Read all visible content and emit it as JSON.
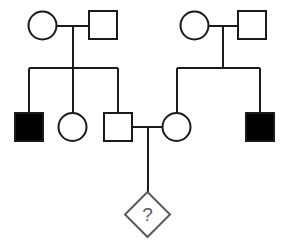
{
  "diagram": {
    "type": "pedigree-chart",
    "canvas": {
      "width": 290,
      "height": 241,
      "background": "#ffffff"
    },
    "style": {
      "line_color": "#1a1a1a",
      "line_width": 2,
      "affected_fill": "#000000",
      "unaffected_fill": "#ffffff",
      "proband_stroke": "#5a5a5a",
      "proband_text_color": "#5a5a5a",
      "symbol_size": 28,
      "circle_radius": 14
    },
    "legend_meaning": {
      "circle": "female",
      "square": "male",
      "filled": "affected",
      "open": "unaffected",
      "diamond": "unknown sex",
      "question_mark": "unknown affected status"
    },
    "generations": [
      {
        "id": "generation-1",
        "label": "I",
        "individuals": [
          {
            "id": "I-1",
            "data_name": "female-symbol-i-1",
            "shape": "circle",
            "sex": "female",
            "affected": false,
            "cx": 42.5,
            "cy": 25.5,
            "r": 14
          },
          {
            "id": "I-2",
            "data_name": "male-symbol-i-2",
            "shape": "square",
            "sex": "male",
            "affected": false,
            "x": 89,
            "y": 11,
            "size": 28
          },
          {
            "id": "I-3",
            "data_name": "female-symbol-i-3",
            "shape": "circle",
            "sex": "female",
            "affected": false,
            "cx": 194.5,
            "cy": 25.5,
            "r": 14
          },
          {
            "id": "I-4",
            "data_name": "male-symbol-i-4",
            "shape": "square",
            "sex": "male",
            "affected": false,
            "x": 238,
            "y": 11,
            "size": 28
          }
        ]
      },
      {
        "id": "generation-2",
        "label": "II",
        "individuals": [
          {
            "id": "II-1",
            "data_name": "affected-male-symbol-ii-1",
            "shape": "square",
            "sex": "male",
            "affected": true,
            "x": 15,
            "y": 113,
            "size": 28
          },
          {
            "id": "II-2",
            "data_name": "female-symbol-ii-2",
            "shape": "circle",
            "sex": "female",
            "affected": false,
            "cx": 72.5,
            "cy": 127,
            "r": 14
          },
          {
            "id": "II-3",
            "data_name": "male-symbol-ii-3",
            "shape": "square",
            "sex": "male",
            "affected": false,
            "x": 104,
            "y": 113,
            "size": 28
          },
          {
            "id": "II-4",
            "data_name": "female-symbol-ii-4",
            "shape": "circle",
            "sex": "female",
            "affected": false,
            "cx": 176.5,
            "cy": 127,
            "r": 14
          },
          {
            "id": "II-5",
            "data_name": "affected-male-symbol-ii-5",
            "shape": "square",
            "sex": "male",
            "affected": true,
            "x": 246,
            "y": 113,
            "size": 28
          }
        ]
      },
      {
        "id": "generation-3",
        "label": "III",
        "individuals": [
          {
            "id": "III-1",
            "data_name": "proband-diamond-symbol-iii-1",
            "shape": "diamond",
            "sex": "unknown",
            "affected": "unknown",
            "cx": 147.5,
            "cy": 214.5,
            "half_diagonal": 22.5,
            "label": "?"
          }
        ]
      }
    ],
    "matings": [
      {
        "id": "mating-1",
        "data_name": "mating-line-i-1-i-2",
        "partners": [
          "I-1",
          "I-2"
        ],
        "line_y": 25.5,
        "x_start": 56.5,
        "x_end": 89,
        "descent_x": 72.5,
        "descent_y_end": 68
      },
      {
        "id": "mating-2",
        "data_name": "mating-line-i-3-i-4",
        "partners": [
          "I-3",
          "I-4"
        ],
        "line_y": 25.5,
        "x_start": 208.5,
        "x_end": 238,
        "descent_x": 223,
        "descent_y_end": 68
      },
      {
        "id": "mating-3",
        "data_name": "mating-line-ii-3-ii-4",
        "partners": [
          "II-3",
          "II-4"
        ],
        "line_y": 127,
        "x_start": 132,
        "x_end": 162.5,
        "descent_x": 147.5,
        "descent_y_end": 192
      }
    ],
    "sibships": [
      {
        "id": "sibship-1",
        "data_name": "sibship-line-left",
        "parents_mating": "mating-1",
        "bar_y": 68,
        "bar_x_start": 29,
        "bar_x_end": 118,
        "children": [
          {
            "id": "II-1",
            "drop_x": 29,
            "drop_y_end": 113
          },
          {
            "id": "II-2",
            "drop_x": 72.5,
            "drop_y_end": 113
          },
          {
            "id": "II-3",
            "drop_x": 118,
            "drop_y_end": 113
          }
        ]
      },
      {
        "id": "sibship-2",
        "data_name": "sibship-line-right",
        "parents_mating": "mating-2",
        "bar_y": 68,
        "bar_x_start": 176.5,
        "bar_x_end": 260,
        "children": [
          {
            "id": "II-4",
            "drop_x": 176.5,
            "drop_y_end": 113
          },
          {
            "id": "II-5",
            "drop_x": 260,
            "drop_y_end": 113
          }
        ]
      },
      {
        "id": "sibship-3",
        "data_name": "sibship-line-center",
        "parents_mating": "mating-3",
        "bar_y": null,
        "children": [
          {
            "id": "III-1",
            "drop_x": 147.5,
            "drop_y_end": 192
          }
        ]
      }
    ]
  }
}
